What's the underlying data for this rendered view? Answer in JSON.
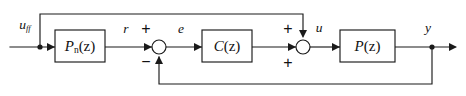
{
  "diagram": {
    "type": "block-diagram",
    "canvas": {
      "width": 466,
      "height": 96
    },
    "colors": {
      "background": "#ffffff",
      "line": "#1a1a1a",
      "text": "#111111",
      "block_fill": "#ffffff"
    },
    "blocks": [
      {
        "id": "feedforward-block",
        "name": "Pn(z)",
        "base": "P",
        "subscript": "n",
        "argument": "(z)",
        "x": 55,
        "y": 30,
        "width": 50,
        "height": 32
      },
      {
        "id": "controller-block",
        "name": "C(z)",
        "base": "C",
        "subscript": "",
        "argument": "(z)",
        "x": 202,
        "y": 30,
        "width": 50,
        "height": 32
      },
      {
        "id": "plant-block",
        "name": "P(z)",
        "base": "P",
        "subscript": "",
        "argument": "(z)",
        "x": 340,
        "y": 30,
        "width": 55,
        "height": 32
      }
    ],
    "summing_junctions": [
      {
        "id": "error-sum",
        "cx": 159,
        "cy": 47,
        "r": 7,
        "signs": [
          {
            "label": "+",
            "position": "top",
            "x": 146,
            "y": 30
          },
          {
            "label": "−",
            "position": "bottom",
            "x": 146,
            "y": 63
          }
        ]
      },
      {
        "id": "control-sum",
        "cx": 303,
        "cy": 47,
        "r": 7,
        "signs": [
          {
            "label": "+",
            "position": "top",
            "x": 288,
            "y": 30
          },
          {
            "label": "+",
            "position": "bottom",
            "x": 288,
            "y": 64
          }
        ]
      }
    ],
    "signals": [
      {
        "id": "uff",
        "base": "u",
        "subscript": "ff",
        "x": 25,
        "y": 26
      },
      {
        "id": "r",
        "base": "r",
        "subscript": "",
        "x": 126,
        "y": 30
      },
      {
        "id": "e",
        "base": "e",
        "subscript": "",
        "x": 181,
        "y": 30
      },
      {
        "id": "u",
        "base": "u",
        "subscript": "",
        "x": 319,
        "y": 29
      },
      {
        "id": "y",
        "base": "y",
        "subscript": "",
        "x": 428,
        "y": 29
      }
    ],
    "nodes": [
      {
        "id": "input-branch-node",
        "cx": 40,
        "cy": 47,
        "r": 2.6
      },
      {
        "id": "output-branch-node",
        "cx": 432,
        "cy": 47,
        "r": 2.6
      }
    ],
    "paths": {
      "input_line": "M 10 47 L 55 47",
      "feedforward_up": "M 40 47 L 40 14 L 303 14 L 303 36",
      "pn_to_error_sum": "M 105 47 L 152 47",
      "error_sum_to_c": "M 166 47 L 202 47",
      "c_to_control_sum": "M 252 47 L 296 47",
      "control_sum_to_p": "M 310 47 L 340 47",
      "p_to_output": "M 395 47 L 455 47",
      "feedback_down": "M 432 47 L 432 84 L 159 84 L 159 57"
    },
    "arrows": [
      {
        "id": "arrow-into-pn",
        "x": 55,
        "y": 47,
        "dir": "right"
      },
      {
        "id": "arrow-into-error-sum",
        "x": 152,
        "y": 47,
        "dir": "right"
      },
      {
        "id": "arrow-into-controller",
        "x": 202,
        "y": 47,
        "dir": "right"
      },
      {
        "id": "arrow-into-control-sum",
        "x": 296,
        "y": 47,
        "dir": "right"
      },
      {
        "id": "arrow-into-plant",
        "x": 340,
        "y": 47,
        "dir": "right"
      },
      {
        "id": "arrow-output-right",
        "x": 455,
        "y": 47,
        "dir": "right"
      },
      {
        "id": "arrow-feedforward-down",
        "x": 303,
        "y": 37,
        "dir": "down"
      },
      {
        "id": "arrow-feedback-up",
        "x": 159,
        "y": 57,
        "dir": "up"
      }
    ]
  }
}
